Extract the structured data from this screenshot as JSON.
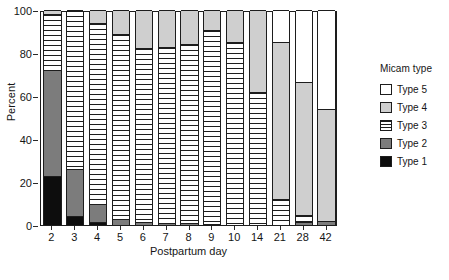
{
  "chart_data": {
    "type": "bar",
    "stacked": true,
    "normalized_percent": true,
    "title": "",
    "xlabel": "Postpartum day",
    "ylabel": "Percent",
    "ylim": [
      0,
      100
    ],
    "yticks": [
      0,
      20,
      40,
      60,
      80,
      100
    ],
    "grid": false,
    "legend_position": "right",
    "legend_title": "Micam type",
    "categories": [
      "2",
      "3",
      "4",
      "5",
      "6",
      "7",
      "8",
      "9",
      "10",
      "14",
      "21",
      "28",
      "42"
    ],
    "series": [
      {
        "name": "Type 1",
        "color": "#0d0d0d",
        "pattern": "solid-black",
        "values": [
          23,
          4,
          1.5,
          0,
          0,
          0,
          0,
          0,
          0,
          0,
          0,
          0,
          0
        ]
      },
      {
        "name": "Type 2",
        "color": "#7c7c7c",
        "pattern": "solid-gray",
        "values": [
          49,
          22,
          8.5,
          3,
          1.5,
          1,
          1,
          0.5,
          0,
          0,
          0,
          1.5,
          2
        ]
      },
      {
        "name": "Type 3",
        "color": "#ffffff",
        "pattern": "horizontal-stripes",
        "values": [
          26,
          74,
          84,
          86,
          81,
          82,
          83,
          90,
          85,
          62,
          12,
          3,
          0
        ]
      },
      {
        "name": "Type 4",
        "color": "#cfcfcf",
        "pattern": "solid-light-gray",
        "values": [
          2,
          0,
          6,
          11,
          17.5,
          17,
          16,
          9.5,
          15,
          38,
          73,
          62,
          52
        ]
      },
      {
        "name": "Type 5",
        "color": "#ffffff",
        "pattern": "empty-white",
        "values": [
          0,
          0,
          0,
          0,
          0,
          0,
          0,
          0,
          0,
          0,
          15,
          33.5,
          46
        ]
      }
    ]
  },
  "axes": {
    "y": {
      "label": "Percent",
      "ticks": [
        "0",
        "20",
        "40",
        "60",
        "80",
        "100"
      ]
    },
    "x": {
      "label": "Postpartum day",
      "ticks": [
        "2",
        "3",
        "4",
        "5",
        "6",
        "7",
        "8",
        "9",
        "10",
        "14",
        "21",
        "28",
        "42"
      ]
    }
  },
  "legend": {
    "title": "Micam type",
    "items": [
      {
        "label": "Type 5",
        "swatch": "white"
      },
      {
        "label": "Type 4",
        "swatch": "light-gray"
      },
      {
        "label": "Type 3",
        "swatch": "striped"
      },
      {
        "label": "Type 2",
        "swatch": "dark-gray"
      },
      {
        "label": "Type 1",
        "swatch": "black"
      }
    ]
  },
  "caption": {
    "text": ""
  }
}
